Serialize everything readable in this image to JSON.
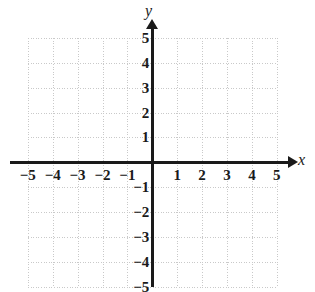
{
  "figure": {
    "type": "coordinate-plane",
    "background_color": "#ffffff",
    "axis_color": "#1a1a1a",
    "grid_color": "#c9c9c9"
  },
  "axis_labels": {
    "x": "x",
    "y": "y"
  },
  "chart_data": {
    "type": "scatter",
    "title": "",
    "xlabel": "x",
    "ylabel": "y",
    "xlim": [
      -5,
      5
    ],
    "ylim": [
      -5,
      5
    ],
    "grid": true,
    "grid_style": "dotted",
    "grid_spacing": 1,
    "legend": "none",
    "series": [],
    "x_tick_values": [
      -5,
      -4,
      -3,
      -2,
      -1,
      1,
      2,
      3,
      4,
      5
    ],
    "y_tick_values": [
      5,
      4,
      3,
      2,
      1,
      -1,
      -2,
      -3,
      -4,
      -5
    ],
    "x_tick_labels": [
      "−5",
      "−4",
      "−3",
      "−2",
      "−1",
      "1",
      "2",
      "3",
      "4",
      "5"
    ],
    "y_tick_labels": [
      "5",
      "4",
      "3",
      "2",
      "1",
      "−1",
      "−2",
      "−3",
      "−4",
      "−5"
    ],
    "annotations": [
      {
        "name": "x-axis-arrow",
        "direction": "right"
      },
      {
        "name": "y-axis-arrow",
        "direction": "up"
      }
    ]
  }
}
